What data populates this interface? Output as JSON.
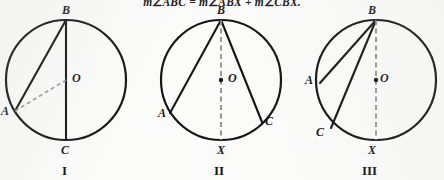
{
  "header": {
    "equation": "m∠ABC = m∠ABX + m∠CBX."
  },
  "figures": [
    {
      "id": "figure-1",
      "caption": "I",
      "circle": {
        "cx": 66,
        "cy": 80,
        "r": 60
      },
      "center_label": "O",
      "points": [
        {
          "name": "B",
          "label": "B",
          "x": 66,
          "y": 20,
          "label_x": 62,
          "label_y": 6
        },
        {
          "name": "A",
          "label": "A",
          "x": 15,
          "y": 111,
          "label_x": 2,
          "label_y": 111
        },
        {
          "name": "C",
          "label": "C",
          "x": 66,
          "y": 140,
          "label_x": 62,
          "label_y": 146
        },
        {
          "name": "O",
          "label": "O",
          "x": 66,
          "y": 80,
          "label_x": 72,
          "label_y": 74
        }
      ],
      "solid_chords": [
        {
          "from": "B",
          "to": "A"
        },
        {
          "from": "B",
          "to": "C"
        }
      ],
      "dashed_segments": [
        {
          "from": "A",
          "to": "O"
        }
      ],
      "center_dot": false
    },
    {
      "id": "figure-2",
      "caption": "II",
      "circle": {
        "cx": 221,
        "cy": 80,
        "r": 60
      },
      "center_label": "O",
      "points": [
        {
          "name": "B",
          "label": "B",
          "x": 221,
          "y": 20,
          "label_x": 217,
          "label_y": 6
        },
        {
          "name": "A",
          "label": "A",
          "x": 170,
          "y": 113,
          "label_x": 159,
          "label_y": 113
        },
        {
          "name": "C",
          "label": "C",
          "x": 262,
          "y": 122,
          "label_x": 266,
          "label_y": 120
        },
        {
          "name": "X",
          "label": "X",
          "x": 221,
          "y": 140,
          "label_x": 217,
          "label_y": 147
        },
        {
          "name": "O",
          "label": "O",
          "x": 221,
          "y": 80,
          "label_x": 228,
          "label_y": 74
        }
      ],
      "solid_chords": [
        {
          "from": "B",
          "to": "A"
        },
        {
          "from": "B",
          "to": "C"
        }
      ],
      "dashed_segments": [
        {
          "from": "B",
          "to": "X"
        }
      ],
      "center_dot": true
    },
    {
      "id": "figure-3",
      "caption": "III",
      "circle": {
        "cx": 376,
        "cy": 80,
        "r": 60
      },
      "center_label": "O",
      "points": [
        {
          "name": "B",
          "label": "B",
          "x": 376,
          "y": 20,
          "label_x": 372,
          "label_y": 6
        },
        {
          "name": "A",
          "label": "A",
          "x": 320,
          "y": 83,
          "label_x": 308,
          "label_y": 80
        },
        {
          "name": "C",
          "label": "C",
          "x": 331,
          "y": 128,
          "label_x": 318,
          "label_y": 131
        },
        {
          "name": "X",
          "label": "X",
          "x": 376,
          "y": 140,
          "label_x": 372,
          "label_y": 147
        },
        {
          "name": "O",
          "label": "O",
          "x": 376,
          "y": 80,
          "label_x": 383,
          "label_y": 74
        }
      ],
      "solid_chords": [
        {
          "from": "B",
          "to": "A"
        },
        {
          "from": "B",
          "to": "C"
        }
      ],
      "dashed_segments": [
        {
          "from": "B",
          "to": "X"
        }
      ],
      "center_dot": true
    }
  ],
  "style": {
    "stroke_color": "#161617",
    "dashed_color_light": "#9b9b9b",
    "dashed_color_dark": "#8c8c8c",
    "background": "#fbfbfa",
    "circle_stroke_width": 2.2,
    "chord_stroke_width": 2.0
  }
}
